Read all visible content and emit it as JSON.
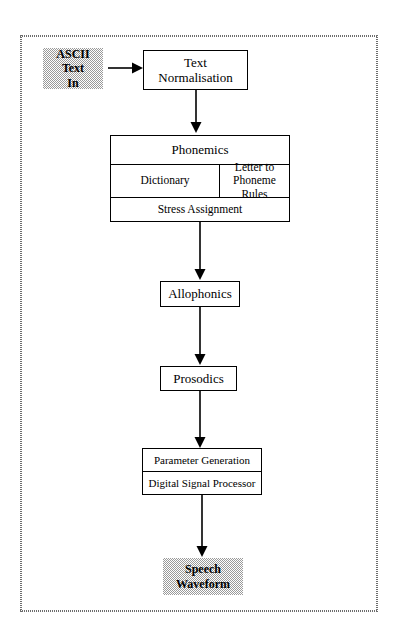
{
  "diagram": {
    "frame": {
      "style": "stippled-rectangle"
    },
    "nodes": {
      "ascii_in": {
        "label": "ASCII\nText\nIn",
        "fill": "#9a9a9a",
        "shaded": true
      },
      "text_normalisation": {
        "label": "Text\nNormalisation"
      },
      "phonemics": {
        "header": "Phonemics",
        "dictionary": "Dictionary",
        "letter_to_phoneme_rules": "Letter to\nPhoneme Rules",
        "stress_assignment": "Stress Assignment"
      },
      "allophonics": {
        "label": "Allophonics"
      },
      "prosodics": {
        "label": "Prosodics"
      },
      "synthesis": {
        "parameter_generation": "Parameter Generation",
        "digital_signal_processor": "Digital Signal Processor"
      },
      "speech_waveform": {
        "label": "Speech\nWaveform",
        "fill": "#9a9a9a",
        "shaded": true
      }
    },
    "edges": [
      {
        "from": "ascii_in",
        "to": "text_normalisation",
        "direction": "right"
      },
      {
        "from": "text_normalisation",
        "to": "phonemics",
        "direction": "down"
      },
      {
        "from": "phonemics",
        "to": "allophonics",
        "direction": "down"
      },
      {
        "from": "allophonics",
        "to": "prosodics",
        "direction": "down"
      },
      {
        "from": "prosodics",
        "to": "synthesis",
        "direction": "down"
      },
      {
        "from": "synthesis",
        "to": "speech_waveform",
        "direction": "down"
      }
    ],
    "colors": {
      "line": "#000000",
      "shade": "#9a9a9a",
      "frame": "#6d6d6d",
      "background": "#ffffff"
    }
  }
}
